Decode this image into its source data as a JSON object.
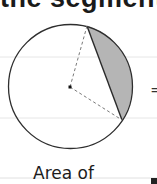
{
  "heading": {
    "text": "the segment"
  },
  "diagram": {
    "circle": {
      "cx": 70.5,
      "cy": 86.5,
      "r": 62
    },
    "center_point": {
      "x": 70,
      "y": 87
    },
    "chord_endpoints": [
      {
        "x": 87,
        "y": 26
      },
      {
        "x": 122,
        "y": 120
      }
    ],
    "segment_fill": "#b3b3b3",
    "outline_color": "#333333",
    "radius_dash_color": "#777777",
    "ruled_lines_y": [
      57,
      118,
      178
    ],
    "ruled_line_color": "#e4e4e4"
  },
  "equals_sign": "=",
  "caption": {
    "text": "Area of"
  }
}
